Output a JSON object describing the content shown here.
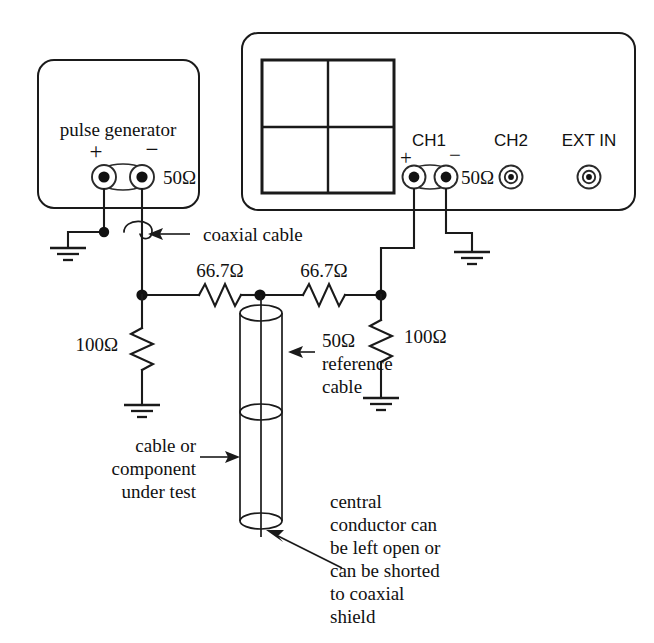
{
  "figure": {
    "ink_color": "#1a1a1a",
    "background_color": "#ffffff"
  },
  "pulse_generator": {
    "label": "pulse generator",
    "plus_label": "+",
    "minus_label": "−",
    "impedance_label": "50Ω",
    "connector_icons": [
      "bnc-connector-icon",
      "bnc-connector-icon"
    ]
  },
  "oscilloscope": {
    "screen_name": "crt-screen",
    "channels": [
      {
        "name": "CH1",
        "plus_label": "+",
        "minus_label": "−",
        "impedance_label": "50Ω",
        "connector_icons": [
          "bnc-connector-icon",
          "bnc-connector-icon"
        ]
      },
      {
        "name": "CH2",
        "connector_icons": [
          "bnc-connector-icon"
        ]
      },
      {
        "name": "EXT IN",
        "connector_icons": [
          "bnc-connector-icon"
        ]
      }
    ]
  },
  "annotations": {
    "coaxial_cable": "coaxial cable",
    "reference_cable": [
      "50Ω",
      "reference",
      "cable"
    ],
    "device_under_test": [
      "cable or",
      "component",
      "under test"
    ],
    "central_conductor": [
      "central",
      "conductor can",
      "be left open or",
      "can be shorted",
      "to coaxial",
      "shield"
    ]
  },
  "components": {
    "series_resistor_left": "66.7Ω",
    "series_resistor_right": "66.7Ω",
    "shunt_resistor_left": "100Ω",
    "shunt_resistor_right": "100Ω"
  },
  "ground_symbols": {
    "count": 4,
    "icon": "earth-ground-icon"
  }
}
